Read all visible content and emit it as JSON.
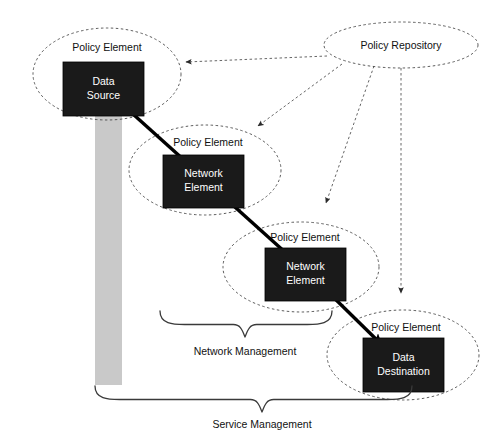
{
  "diagram": {
    "background_color": "#ffffff",
    "box_fill_color": "#1a1a1a",
    "box_text_color": "#ffffff",
    "scope_bar_color": "#c9c9c9",
    "dashed_stroke_color": "#4a4a4a",
    "flow_stroke_color": "#000000"
  },
  "repository": {
    "label": "Policy Repository",
    "cx": 401,
    "cy": 45,
    "rx": 77,
    "ry": 23
  },
  "policy_elements": [
    {
      "id": "policy-element-data-source",
      "ellipse_label": "Policy Element",
      "box_line1": "Data",
      "box_line2": "Source",
      "cx": 107,
      "cy": 74,
      "rx": 74,
      "ry": 46,
      "label_x": 107,
      "label_y": 48,
      "box_x": 63,
      "box_y": 62,
      "box_w": 81,
      "box_h": 54
    },
    {
      "id": "policy-element-network-element-1",
      "ellipse_label": "Policy Element",
      "box_line1": "Network",
      "box_line2": "Element",
      "cx": 205,
      "cy": 170,
      "rx": 76,
      "ry": 45,
      "label_x": 208,
      "label_y": 143,
      "box_x": 163,
      "box_y": 155,
      "box_w": 81,
      "box_h": 53
    },
    {
      "id": "policy-element-network-element-2",
      "ellipse_label": "Policy Element",
      "box_line1": "Network",
      "box_line2": "Element",
      "cx": 301,
      "cy": 267,
      "rx": 78,
      "ry": 45,
      "label_x": 305,
      "label_y": 238,
      "box_x": 265,
      "box_y": 248,
      "box_w": 81,
      "box_h": 53
    },
    {
      "id": "policy-element-data-destination",
      "ellipse_label": "Policy Element",
      "box_line1": "Data",
      "box_line2": "Destination",
      "cx": 403,
      "cy": 355,
      "rx": 76,
      "ry": 45,
      "label_x": 406,
      "label_y": 328,
      "box_x": 363,
      "box_y": 338,
      "box_w": 81,
      "box_h": 54
    }
  ],
  "policy_links": [
    {
      "id": "repository-to-data-source",
      "from": "Policy Repository",
      "to": "Policy Element (Data Source)",
      "path": "M 327 56 L 186 62"
    },
    {
      "id": "repository-to-network-element-1",
      "from": "Policy Repository",
      "to": "Policy Element (Network Element)",
      "path": "M 342 64 L 258 126"
    },
    {
      "id": "repository-to-network-element-2",
      "from": "Policy Repository",
      "to": "Policy Element (Network Element)",
      "path": "M 374 66 L 326 203"
    },
    {
      "id": "repository-to-data-destination",
      "from": "Policy Repository",
      "to": "Policy Element (Data Destination)",
      "path": "M 401 68 L 401 293"
    }
  ],
  "flow_links": [
    {
      "id": "flow-data-source-to-network-element-1",
      "from": "Data Source",
      "to": "Network Element",
      "path": "M 124 106 L 184 160"
    },
    {
      "id": "flow-network-element-1-to-network-element-2",
      "from": "Network Element",
      "to": "Network Element",
      "path": "M 226 199 L 286 253"
    },
    {
      "id": "flow-network-element-2-to-data-destination",
      "from": "Network Element",
      "to": "Data Destination",
      "path": "M 327 291 L 380 343"
    }
  ],
  "scope_bar": {
    "id": "service-scope-bar",
    "x": 95,
    "y": 115,
    "width": 27,
    "height": 270
  },
  "braces": [
    {
      "id": "network-management-brace",
      "label": "Network Management",
      "left": 160,
      "right": 332,
      "top": 311,
      "tip_x": 245,
      "tip_y": 337,
      "label_x": 245,
      "label_y": 352
    },
    {
      "id": "service-management-brace",
      "label": "Service Management",
      "left": 95,
      "right": 412,
      "top": 386,
      "tip_x": 262,
      "tip_y": 412,
      "label_x": 262,
      "label_y": 425
    }
  ]
}
